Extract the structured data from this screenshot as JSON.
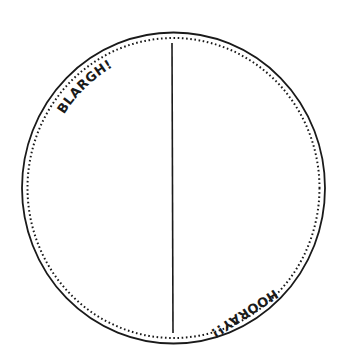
{
  "diagram": {
    "type": "divided-circle",
    "colors": {
      "stroke": "#1a1a1a",
      "background": "#ffffff"
    },
    "labels": {
      "top_left": "BLARGH!",
      "bottom_right": "HOORAY!!"
    },
    "sections": [
      {
        "position": "left",
        "label": "BLARGH!"
      },
      {
        "position": "right",
        "label": "HOORAY!!"
      }
    ]
  }
}
